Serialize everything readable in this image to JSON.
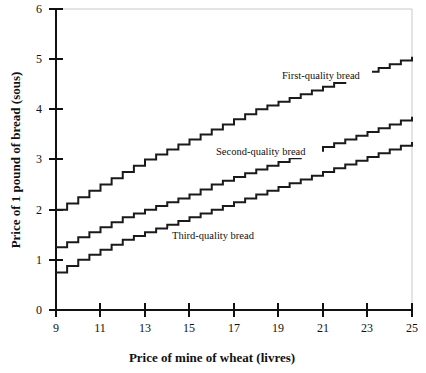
{
  "chart_data": {
    "type": "line",
    "title": "",
    "xlabel": "Price of mine of wheat (livres)",
    "ylabel": "Price of 1 pound of bread (sous)",
    "xlim": [
      9,
      25
    ],
    "ylim": [
      0,
      6
    ],
    "xticks": [
      9,
      11,
      13,
      15,
      17,
      19,
      21,
      23,
      25
    ],
    "xtick_labels": [
      "9",
      "11",
      "13",
      "15",
      "17",
      "19",
      "21",
      "23",
      "25"
    ],
    "yticks": [
      0,
      1,
      2,
      3,
      4,
      5,
      6
    ],
    "ytick_labels": [
      "0",
      "1",
      "2",
      "3",
      "4",
      "5",
      "6"
    ],
    "grid": false,
    "legend_position": "inline-annotations",
    "step_style": "post",
    "series": [
      {
        "name": "First-quality bread",
        "annotation": "First-quality bread",
        "x": [
          9,
          10,
          11,
          12,
          13,
          14,
          15,
          16,
          17,
          18,
          19,
          20,
          21,
          22,
          23,
          24,
          25
        ],
        "values": [
          2.0,
          2.25,
          2.5,
          2.75,
          3.0,
          3.2,
          3.4,
          3.6,
          3.8,
          4.0,
          4.15,
          4.3,
          4.45,
          4.6,
          4.75,
          4.9,
          5.05
        ]
      },
      {
        "name": "Second-quality bread",
        "annotation": "Second-quality bread",
        "x": [
          9,
          10,
          11,
          12,
          13,
          14,
          15,
          16,
          17,
          18,
          19,
          20,
          21,
          22,
          23,
          24,
          25
        ],
        "values": [
          1.25,
          1.45,
          1.65,
          1.85,
          2.0,
          2.15,
          2.3,
          2.5,
          2.65,
          2.8,
          2.95,
          3.1,
          3.25,
          3.4,
          3.55,
          3.7,
          3.85
        ]
      },
      {
        "name": "Third-quality bread",
        "annotation": "Third-quality bread",
        "x": [
          9,
          10,
          11,
          12,
          13,
          14,
          15,
          16,
          17,
          18,
          19,
          20,
          21,
          22,
          23,
          24,
          25
        ],
        "values": [
          0.75,
          1.0,
          1.2,
          1.4,
          1.55,
          1.7,
          1.85,
          2.0,
          2.15,
          2.3,
          2.45,
          2.6,
          2.75,
          2.9,
          3.05,
          3.2,
          3.35
        ]
      }
    ],
    "annotations": [
      {
        "text": "First-quality bread",
        "x": 18.6,
        "y": 4.45
      },
      {
        "text": "Second-quality bread",
        "x": 15.9,
        "y": 3.05
      },
      {
        "text": "Third-quality bread",
        "x": 13.9,
        "y": 1.73
      }
    ],
    "colors": {
      "line": "#1a1a1a",
      "axis": "#111111",
      "background": "#ffffff",
      "frame": "#c9c9c9"
    }
  }
}
